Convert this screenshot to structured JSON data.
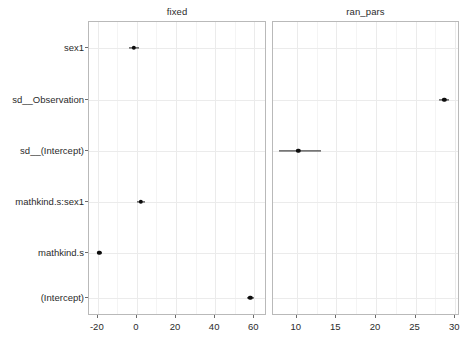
{
  "figure": {
    "width": 467,
    "height": 353,
    "background_color": "#ffffff",
    "point_color": "#0d0d0d",
    "grid_color": "#ebebeb",
    "panel_border_color": "#b9b9b9",
    "axis_text_color": "#2b2b2b"
  },
  "chart_data": {
    "type": "scatter",
    "subtype": "dot-and-whisker coefficient plot",
    "title": "",
    "xlabel": "",
    "ylabel": "",
    "grid": true,
    "legend": false,
    "legend_position": "none",
    "terms": [
      "sex1",
      "sd__Observation",
      "sd__(Intercept)",
      "mathkind.s:sex1",
      "mathkind.s",
      "(Intercept)"
    ],
    "facets": [
      {
        "name": "fixed",
        "strip_label": "fixed",
        "xlim": [
          -24.5,
          66.5
        ],
        "xticks": [
          -20,
          0,
          20,
          40,
          60
        ],
        "xticklabels": [
          "-20",
          "0",
          "20",
          "40",
          "60"
        ],
        "xminor": [
          -10,
          10,
          30,
          50
        ],
        "points": [
          {
            "term": "sex1",
            "estimate": -1.5,
            "conf_low": -3.8,
            "conf_high": 0.9
          },
          {
            "term": "sd__Observation",
            "estimate": null,
            "conf_low": null,
            "conf_high": null
          },
          {
            "term": "sd__(Intercept)",
            "estimate": null,
            "conf_low": null,
            "conf_high": null
          },
          {
            "term": "mathkind.s:sex1",
            "estimate": 1.9,
            "conf_low": 0.1,
            "conf_high": 4.0
          },
          {
            "term": "mathkind.s",
            "estimate": -19.2,
            "conf_low": -20.4,
            "conf_high": -18.0
          },
          {
            "term": "(Intercept)",
            "estimate": 58.0,
            "conf_low": 56.2,
            "conf_high": 60.0
          }
        ]
      },
      {
        "name": "ran_pars",
        "strip_label": "ran_pars",
        "xlim": [
          7.0,
          30.6
        ],
        "xticks": [
          10,
          15,
          20,
          25,
          30
        ],
        "xticklabels": [
          "10",
          "15",
          "20",
          "25",
          "30"
        ],
        "xminor": [
          12.5,
          17.5,
          22.5,
          27.5
        ],
        "points": [
          {
            "term": "sex1",
            "estimate": null,
            "conf_low": null,
            "conf_high": null
          },
          {
            "term": "sd__Observation",
            "estimate": 28.6,
            "conf_low": 28.0,
            "conf_high": 29.2
          },
          {
            "term": "sd__(Intercept)",
            "estimate": 10.2,
            "conf_low": 7.7,
            "conf_high": 13.1
          },
          {
            "term": "mathkind.s:sex1",
            "estimate": null,
            "conf_low": null,
            "conf_high": null
          },
          {
            "term": "mathkind.s",
            "estimate": null,
            "conf_low": null,
            "conf_high": null
          },
          {
            "term": "(Intercept)",
            "estimate": null,
            "conf_low": null,
            "conf_high": null
          }
        ]
      }
    ]
  },
  "layout": {
    "panels": [
      {
        "left": 88,
        "top": 21,
        "width": 178,
        "height": 294
      },
      {
        "left": 272,
        "top": 21,
        "width": 187,
        "height": 294
      }
    ],
    "y_label_right": 84,
    "row_centers": [
      47,
      99,
      150,
      201,
      252,
      297
    ]
  }
}
